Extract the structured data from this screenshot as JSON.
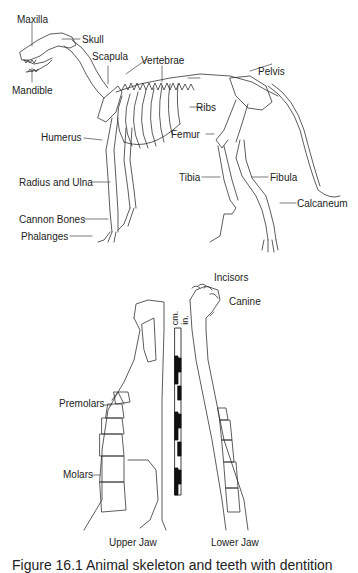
{
  "skeleton": {
    "labels": {
      "maxilla": "Maxilla",
      "skull": "Skull",
      "mandible": "Mandible",
      "scapula": "Scapula",
      "vertebrae": "Vertebrae",
      "pelvis": "Pelvis",
      "ribs": "Ribs",
      "humerus": "Humerus",
      "femur": "Femur",
      "radius_ulna": "Radius and Ulna",
      "tibia": "Tibia",
      "fibula": "Fibula",
      "calcaneum": "Calcaneum",
      "cannon_bones": "Cannon Bones",
      "phalanges": "Phalanges"
    }
  },
  "jaws": {
    "labels": {
      "incisors": "Incisors",
      "canine": "Canine",
      "premolars": "Premolars",
      "molars": "Molars",
      "upper_jaw": "Upper Jaw",
      "lower_jaw": "Lower Jaw"
    },
    "scale": {
      "cm_label": "cm.",
      "in_label": "in."
    }
  },
  "caption": "Figure 16.1 Animal skeleton and teeth with dentition"
}
